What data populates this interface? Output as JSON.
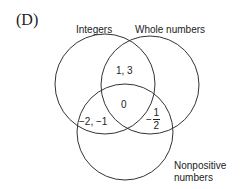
{
  "choice_label": "(D)",
  "sets": [
    {
      "name": "Integers",
      "cx": 105,
      "cy": 84,
      "r": 50
    },
    {
      "name": "Whole numbers",
      "cx": 150,
      "cy": 85,
      "r": 49
    },
    {
      "name": "Nonpositive numbers",
      "line1": "Nonpositive",
      "line2": "numbers",
      "cx": 125,
      "cy": 132,
      "r": 48
    }
  ],
  "regions": {
    "integers_and_whole": "1, 3",
    "all_three": "0",
    "integers_and_nonpositive": "−2, −1",
    "whole_and_nonpositive": {
      "sign": "−",
      "numerator": "1",
      "denominator": "2"
    }
  },
  "colors": {
    "stroke": "#333333",
    "text": "#222222",
    "background": "#ffffff"
  }
}
